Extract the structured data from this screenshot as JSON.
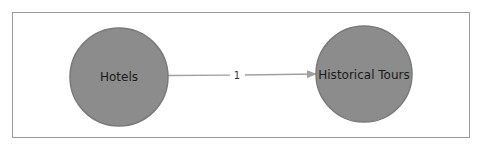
{
  "diagram": {
    "type": "directed-graph",
    "frame": {
      "x": 12,
      "y": 12,
      "width": 458,
      "height": 126,
      "stroke": "#9a9a9a"
    },
    "colors": {
      "node_fill": "#8c8c8c",
      "node_stroke": "#7a7a7a",
      "edge": "#a0a0a0",
      "text": "#1a1a1a"
    },
    "nodes": [
      {
        "id": "hotels",
        "label": "Hotels",
        "cx": 119,
        "cy": 77,
        "r": 49
      },
      {
        "id": "historical-tours",
        "label": "Historical Tours",
        "cx": 364,
        "cy": 74,
        "r": 48
      }
    ],
    "edges": [
      {
        "from": "hotels",
        "to": "historical-tours",
        "label": "1",
        "x1": 168,
        "y1": 75.5,
        "x2": 316,
        "y2": 74,
        "label_x": 237,
        "label_y": 75
      }
    ]
  }
}
